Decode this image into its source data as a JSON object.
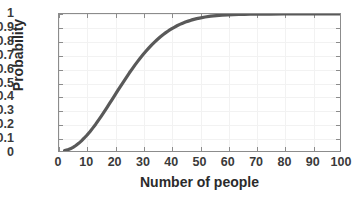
{
  "chart_data": {
    "type": "line",
    "title": "",
    "xlabel": "Number of people",
    "ylabel": "Probability",
    "xlim": [
      0,
      100
    ],
    "ylim": [
      0,
      1
    ],
    "grid": true,
    "legend": null,
    "line_color": "#595959",
    "line_width": 3,
    "axis_color": "#8c8c8c",
    "background": "#ffffff",
    "xticks": [
      "0",
      "10",
      "20",
      "30",
      "40",
      "50",
      "60",
      "70",
      "80",
      "90",
      "100"
    ],
    "xtick_values": [
      0,
      10,
      20,
      30,
      40,
      50,
      60,
      70,
      80,
      90,
      100
    ],
    "yticks": [
      "0",
      "0.1",
      "0.2",
      "0.3",
      "0.4",
      "0.5",
      "0.6",
      "0.7",
      "0.8",
      "0.9",
      "1"
    ],
    "ytick_values": [
      0,
      0.1,
      0.2,
      0.3,
      0.4,
      0.5,
      0.6,
      0.7,
      0.8,
      0.9,
      1
    ],
    "series": [
      {
        "name": "Probability of shared birthday",
        "x": [
          2,
          3,
          4,
          5,
          6,
          7,
          8,
          9,
          10,
          11,
          12,
          13,
          14,
          15,
          16,
          17,
          18,
          19,
          20,
          21,
          22,
          23,
          24,
          25,
          26,
          27,
          28,
          29,
          30,
          31,
          32,
          33,
          34,
          35,
          36,
          37,
          38,
          39,
          40,
          41,
          42,
          43,
          44,
          45,
          46,
          47,
          48,
          49,
          50,
          52,
          54,
          56,
          58,
          60,
          62,
          64,
          66,
          68,
          70,
          75,
          80,
          85,
          90,
          95,
          100
        ],
        "y": [
          0.003,
          0.008,
          0.016,
          0.027,
          0.04,
          0.056,
          0.074,
          0.095,
          0.117,
          0.141,
          0.167,
          0.194,
          0.223,
          0.253,
          0.284,
          0.315,
          0.347,
          0.379,
          0.411,
          0.444,
          0.476,
          0.507,
          0.538,
          0.569,
          0.598,
          0.627,
          0.654,
          0.681,
          0.706,
          0.73,
          0.753,
          0.775,
          0.795,
          0.814,
          0.832,
          0.849,
          0.864,
          0.878,
          0.891,
          0.903,
          0.914,
          0.924,
          0.933,
          0.941,
          0.948,
          0.955,
          0.961,
          0.966,
          0.97,
          0.978,
          0.984,
          0.988,
          0.991,
          0.994,
          0.996,
          0.997,
          0.998,
          0.9985,
          0.9992,
          0.9997,
          0.9999,
          0.99996,
          0.99999,
          1.0,
          1.0
        ]
      }
    ]
  },
  "axes": {
    "xlabel": "Number of people",
    "ylabel": "Probability"
  }
}
